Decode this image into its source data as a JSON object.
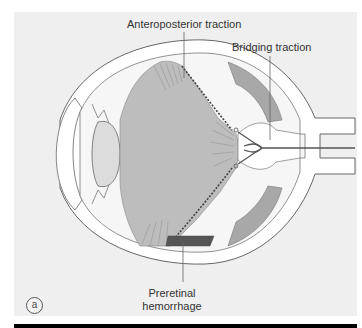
{
  "figure": {
    "panel_letter": "a",
    "labels": {
      "anteroposterior": "Anteroposterior traction",
      "bridging": "Bridging traction",
      "hemorrhage_line1": "Preretinal",
      "hemorrhage_line2": "hemorrhage"
    },
    "colors": {
      "panel_bg": "#efefef",
      "vitreous": "#bdbdbd",
      "lens": "#dcdcdc",
      "hemorrhage": "#555555",
      "detachment_fluid": "#a8a8a8",
      "outline": "#666666",
      "vessels": "#555555"
    }
  }
}
